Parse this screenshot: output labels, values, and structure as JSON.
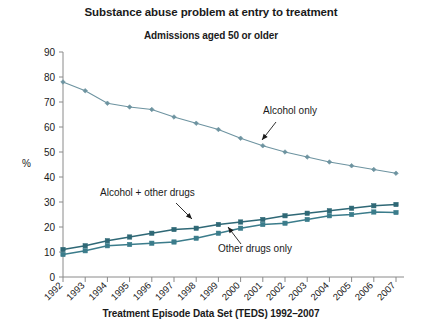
{
  "chart_data": {
    "type": "line",
    "title": "Substance abuse problem at entry to treatment",
    "subtitle": "Admissions aged 50 or older",
    "xlabel": "Treatment Episode Data Set (TEDS) 1992–2007",
    "ylabel": "%",
    "xlim": [
      1992,
      2007
    ],
    "ylim": [
      0,
      90
    ],
    "ytick_step": 10,
    "grid": false,
    "legend": "annotations-inline",
    "categories": [
      "1992",
      "1993",
      "1994",
      "1995",
      "1996",
      "1997",
      "1998",
      "1999",
      "2000",
      "2001",
      "2002",
      "2003",
      "2004",
      "2005",
      "2006",
      "2007"
    ],
    "yticks": [
      "0",
      "10",
      "20",
      "30",
      "40",
      "50",
      "60",
      "70",
      "80",
      "90"
    ],
    "series": [
      {
        "name": "Alcohol only",
        "color": "#6d93a0",
        "marker": "diamond",
        "values": [
          78,
          74.5,
          69.5,
          68,
          67,
          64,
          61.5,
          59,
          55.5,
          52.5,
          50,
          48,
          46,
          44.5,
          43,
          41.5
        ]
      },
      {
        "name": "Alcohol + other drugs",
        "color": "#2f6876",
        "marker": "square",
        "values": [
          11,
          12.5,
          14.5,
          16,
          17.5,
          19,
          19.5,
          21,
          22,
          23,
          24.5,
          25.5,
          26.5,
          27.5,
          28.5,
          29
        ]
      },
      {
        "name": "Other drugs only",
        "color": "#3b7c8b",
        "marker": "square",
        "values": [
          9,
          10.5,
          12.5,
          13,
          13.5,
          14,
          15.5,
          17.5,
          19.5,
          21,
          21.5,
          23,
          24.5,
          25,
          26,
          25.8
        ]
      }
    ],
    "annotations": [
      {
        "label": "Alcohol only",
        "x": 263,
        "y": 114
      },
      {
        "label": "Alcohol + other drugs",
        "x": 100,
        "y": 196
      },
      {
        "label": "Other drugs only",
        "x": 218,
        "y": 252
      }
    ]
  }
}
